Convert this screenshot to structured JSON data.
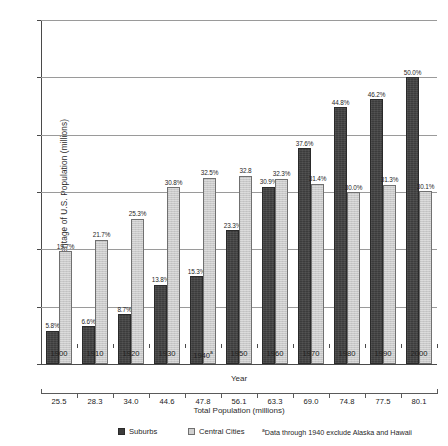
{
  "chart_data": {
    "type": "bar",
    "title": "",
    "xlabel": "Year",
    "ylabel": "Percentage of U.S. Population (millions)",
    "ylim": [
      0,
      60
    ],
    "yticks": [
      0,
      10,
      20,
      30,
      40,
      50,
      60
    ],
    "grid": true,
    "legend_position": "bottom",
    "categories": [
      "1900",
      "1910",
      "1920",
      "1930",
      "1940a",
      "1950",
      "1960",
      "1970",
      "1980",
      "1990",
      "2000"
    ],
    "category_labels": [
      "1900",
      "1910",
      "1920",
      "1930",
      "1940",
      "1950",
      "1960",
      "1970",
      "1980",
      "1990",
      "2000"
    ],
    "category_superscripts": [
      "",
      "",
      "",
      "",
      "a",
      "",
      "",
      "",
      "",
      "",
      ""
    ],
    "series": [
      {
        "name": "Suburbs",
        "color": "#3c3c3c",
        "values": [
          5.8,
          6.6,
          8.7,
          13.8,
          15.3,
          23.3,
          30.9,
          37.6,
          44.8,
          46.2,
          50.0
        ],
        "labels": [
          "5.8%",
          "6.6%",
          "8.7%",
          "13.8%",
          "15.3%",
          "23.3%",
          "30.9%",
          "37.6%",
          "44.8%",
          "46.2%",
          "50.0%"
        ]
      },
      {
        "name": "Central Cities",
        "color": "#c9c9c9",
        "values": [
          19.7,
          21.7,
          25.3,
          30.8,
          32.5,
          32.8,
          32.3,
          31.4,
          30.0,
          31.3,
          30.1
        ],
        "labels": [
          "19.7%",
          "21.7%",
          "25.3%",
          "30.8%",
          "32.5%",
          "32.8",
          "32.3%",
          "31.4%",
          "30.0%",
          "31.3%",
          "30.1%"
        ]
      }
    ],
    "secondary_axis": {
      "title": "Total Population (millions)",
      "values": [
        25.5,
        28.3,
        34.0,
        44.6,
        47.8,
        56.1,
        63.3,
        69.0,
        74.8,
        77.5,
        80.1
      ],
      "labels": [
        "25.5",
        "28.3",
        "34.0",
        "44.6",
        "47.8",
        "56.1",
        "63.3",
        "69.0",
        "74.8",
        "77.5",
        "80.1"
      ]
    },
    "annotations": [
      "aData through 1940 exclude Alaska and Hawaii"
    ]
  },
  "legend": {
    "items": [
      {
        "label": "Suburbs",
        "swatch": "suburb"
      },
      {
        "label": "Central Cities",
        "swatch": "central"
      }
    ],
    "footnote_marker": "a",
    "footnote_text": "Data through 1940 exclude Alaska and Hawaii"
  }
}
